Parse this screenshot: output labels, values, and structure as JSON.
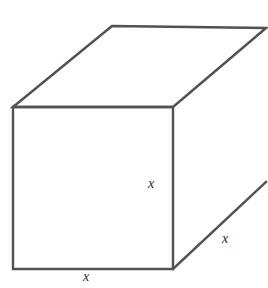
{
  "figure": {
    "shape_name": "cube",
    "background_color": "#ffffff",
    "stroke_color": "#555052",
    "label_color": "#2e2b2c",
    "labels": {
      "height": "x",
      "width": "x",
      "depth": "x"
    },
    "geometry": {
      "front_top_left": "13,107",
      "front_top_right": "173,107",
      "front_bottom_right": "173,269",
      "front_bottom_left": "13,269",
      "back_top_left": "112,26",
      "back_top_right": "266,28",
      "back_bottom_right": "266,182",
      "front_face_path": "M 13 107 L 173 107 L 173 269 L 13 269 Z",
      "top_face_path": "M 13 107 L 112 26 L 266 28 L 173 107 Z",
      "right_face_path": "M 173 107 L 266 28 L 266 182 L 173 269 Z",
      "right_bottom_edge_path": "M 173 269 L 266 182"
    }
  }
}
